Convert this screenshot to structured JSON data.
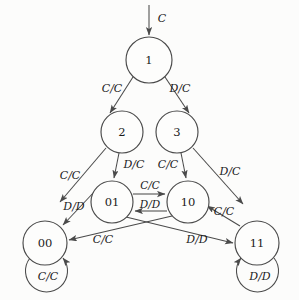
{
  "diagram": {
    "type": "finite-state-machine",
    "title": "",
    "stroke_color": "#4a4a4a",
    "text_color": "#1a1a1a",
    "background_color": "#fcfcfb",
    "start": {
      "label": "C",
      "target": "1",
      "arrow_name": "start-arrow"
    },
    "states": [
      {
        "id": "s1",
        "label": "1",
        "cx": 149,
        "cy": 60,
        "r": 23
      },
      {
        "id": "s2",
        "label": "2",
        "cx": 122,
        "cy": 132,
        "r": 21
      },
      {
        "id": "s3",
        "label": "3",
        "cx": 177,
        "cy": 132,
        "r": 21
      },
      {
        "id": "s01",
        "label": "01",
        "cx": 112,
        "cy": 202,
        "r": 21
      },
      {
        "id": "s10",
        "label": "10",
        "cx": 188,
        "cy": 202,
        "r": 21
      },
      {
        "id": "s00",
        "label": "00",
        "cx": 45,
        "cy": 243,
        "r": 22
      },
      {
        "id": "s11",
        "label": "11",
        "cx": 257,
        "cy": 243,
        "r": 22
      }
    ],
    "transitions": [
      {
        "name": "edge-1-to-2",
        "from": "1",
        "to": "2",
        "label": "C/C",
        "lx": 112,
        "ly": 89
      },
      {
        "name": "edge-1-to-3",
        "from": "1",
        "to": "3",
        "label": "D/C",
        "lx": 180,
        "ly": 89
      },
      {
        "name": "edge-2-to-01",
        "from": "2",
        "to": "01",
        "label": "D/C",
        "lx": 132,
        "ly": 165
      },
      {
        "name": "edge-2-to-00",
        "from": "2",
        "to": "00",
        "label": "C/C",
        "lx": 70,
        "ly": 176
      },
      {
        "name": "edge-3-to-10",
        "from": "3",
        "to": "10",
        "label": "C/C",
        "lx": 170,
        "ly": 165
      },
      {
        "name": "edge-3-to-11",
        "from": "3",
        "to": "11",
        "label": "D/C",
        "lx": 228,
        "ly": 172
      },
      {
        "name": "edge-01-to-10",
        "from": "01",
        "to": "10",
        "label": "C/C",
        "lx": 150,
        "ly": 186
      },
      {
        "name": "edge-10-to-01",
        "from": "10",
        "to": "01",
        "label": "D/D",
        "lx": 150,
        "ly": 205
      },
      {
        "name": "edge-00-to-01",
        "from": "00",
        "to": "01",
        "label": "D/D",
        "lx": 73,
        "ly": 207
      },
      {
        "name": "edge-11-to-10",
        "from": "11",
        "to": "10",
        "label": "C/C",
        "lx": 224,
        "ly": 212
      },
      {
        "name": "edge-10-to-00",
        "from": "10",
        "to": "00",
        "label": "C/C",
        "lx": 103,
        "ly": 240
      },
      {
        "name": "edge-01-to-11",
        "from": "01",
        "to": "11",
        "label": "D/D",
        "lx": 197,
        "ly": 240
      }
    ],
    "self_loops": [
      {
        "name": "self-loop-00",
        "state": "00",
        "label": "C/C",
        "lx": 48,
        "ly": 276
      },
      {
        "name": "self-loop-11",
        "state": "11",
        "label": "D/D",
        "lx": 260,
        "ly": 276
      }
    ]
  }
}
